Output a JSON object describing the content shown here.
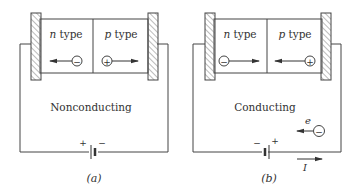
{
  "panels": [
    {
      "id": "a",
      "left_region": {
        "letter": "n",
        "word": " type",
        "carrier": "−"
      },
      "right_region": {
        "letter": "p",
        "word": " type",
        "carrier": "+"
      },
      "state_label": "Nonconducting",
      "battery_left_sign": "+",
      "battery_right_sign": "−",
      "caption": "(a)"
    },
    {
      "id": "b",
      "left_region": {
        "letter": "n",
        "word": " type",
        "carrier": "−"
      },
      "right_region": {
        "letter": "p",
        "word": " type",
        "carrier": "+"
      },
      "state_label": "Conducting",
      "battery_left_sign": "−",
      "battery_right_sign": "+",
      "caption": "(b)",
      "electron_label": "e",
      "electron_carrier": "−",
      "current_label": "I"
    }
  ],
  "colors": {
    "line": "#444444",
    "text": "#333333",
    "hatch": "#777777"
  }
}
